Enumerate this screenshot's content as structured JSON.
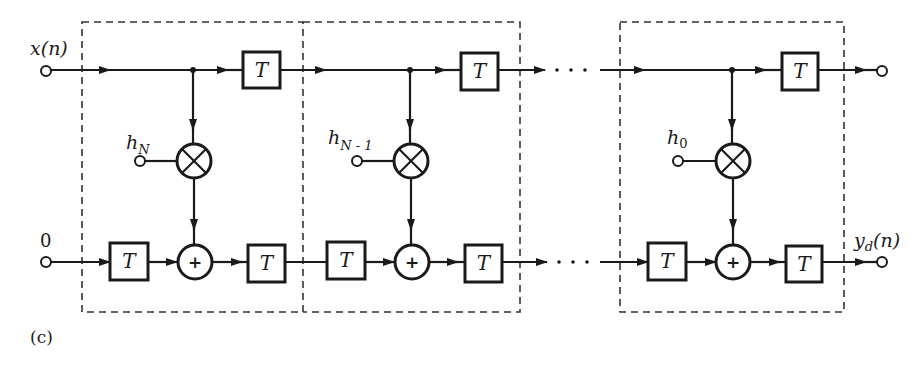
{
  "figure": {
    "panel_label": "(c)",
    "inputs": {
      "top": "x(n)",
      "bottom": "0"
    },
    "outputs": {
      "bottom_base": "y",
      "bottom_sub": "d",
      "bottom_arg": "(n)"
    },
    "delay_label": "T",
    "adder_symbol": "+",
    "stages": [
      {
        "coef_base": "h",
        "coef_sub": "N"
      },
      {
        "coef_base": "h",
        "coef_sub": "N - 1"
      },
      {
        "coef_base": "h",
        "coef_sub": "0"
      }
    ],
    "ellipsis": "· · ·"
  },
  "colors": {
    "ink": "#1a1a1a",
    "background": "#ffffff"
  }
}
